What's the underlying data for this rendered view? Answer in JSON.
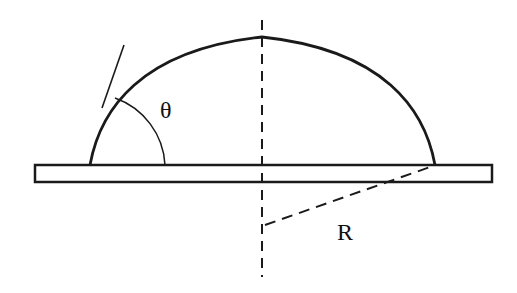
{
  "diagram": {
    "type": "contact-angle-droplet",
    "labels": {
      "angle": "θ",
      "radius": "R"
    },
    "colors": {
      "stroke": "#1a1a1a",
      "background": "#ffffff"
    }
  }
}
